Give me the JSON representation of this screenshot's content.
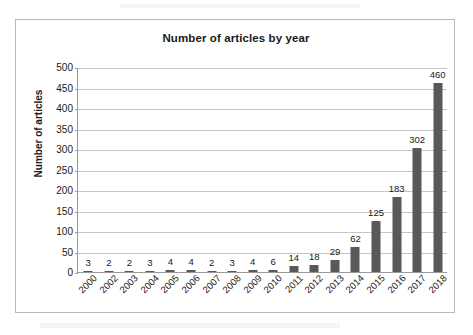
{
  "chart_data": {
    "type": "bar",
    "title": "Number of articles by year",
    "xlabel": "",
    "ylabel": "Number of articles",
    "categories": [
      "2000",
      "2002",
      "2003",
      "2004",
      "2005",
      "2006",
      "2007",
      "2008",
      "2009",
      "2010",
      "2011",
      "2012",
      "2013",
      "2014",
      "2015",
      "2016",
      "2017",
      "2018"
    ],
    "values": [
      3,
      2,
      2,
      3,
      4,
      4,
      2,
      3,
      4,
      6,
      14,
      18,
      29,
      62,
      125,
      183,
      302,
      460
    ],
    "ylim": [
      0,
      500
    ],
    "y_ticks": [
      0,
      50,
      100,
      150,
      200,
      250,
      300,
      350,
      400,
      450,
      500
    ],
    "y_tick_labels": [
      "0",
      "50",
      "100",
      "150",
      "200",
      "250",
      "300",
      "350",
      "400",
      "450",
      "500"
    ],
    "grid": "horizontal",
    "legend": "none",
    "bar_color": "#595959",
    "gridline_color": "#c6c6c6",
    "axis_color": "#9a9a9a",
    "frame_color": "#b9b9b9",
    "background_color": "#ffffff",
    "data_labels_shown": true
  }
}
